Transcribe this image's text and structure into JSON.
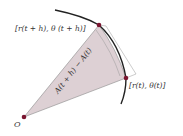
{
  "diagram": {
    "labels": {
      "upper_point": "[r(t + h), θ (t + h)]",
      "right_point": "[r(t), θ(t)]",
      "origin": "O",
      "area": "A(t + h) − A(t)"
    },
    "colors": {
      "sector_fill": "#ddd0d4",
      "point": "#7a1530",
      "curve": "#222222",
      "edge": "#999999"
    }
  }
}
